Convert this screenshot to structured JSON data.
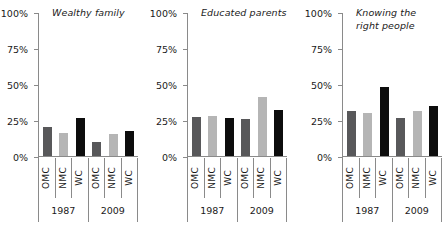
{
  "chart_data": {
    "type": "bar",
    "title": "",
    "xlabel": "",
    "ylabel": "",
    "ylim": [
      0,
      100
    ],
    "ytick_labels": [
      "100%",
      "75%",
      "50%",
      "25%",
      "0%"
    ],
    "ytick_values": [
      100,
      75,
      50,
      25,
      0
    ],
    "grid": false,
    "legend": "none",
    "categories": [
      "OMC",
      "NMC",
      "WC",
      "OMC",
      "NMC",
      "WC"
    ],
    "groups": [
      "1987",
      "2009"
    ],
    "group_span": 3,
    "colors": {
      "OMC": "#58585a",
      "NMC": "#b5b5b5",
      "WC": "#0d0d0d",
      "axis": "#8a8a8a",
      "text": "#1a1a1a",
      "background": "#ffffff"
    },
    "panels": [
      {
        "title": "Wealthy family",
        "values": [
          20,
          16,
          26.5,
          10,
          15.5,
          17.5
        ],
        "series": [
          {
            "name": "1987",
            "categories": [
              "OMC",
              "NMC",
              "WC"
            ],
            "values": [
              20,
              16,
              26.5
            ]
          },
          {
            "name": "2009",
            "categories": [
              "OMC",
              "NMC",
              "WC"
            ],
            "values": [
              10,
              15.5,
              17.5
            ]
          }
        ]
      },
      {
        "title": "Educated parents",
        "values": [
          27,
          27.5,
          26.5,
          25.5,
          41,
          32
        ],
        "series": [
          {
            "name": "1987",
            "categories": [
              "OMC",
              "NMC",
              "WC"
            ],
            "values": [
              27,
              27.5,
              26.5
            ]
          },
          {
            "name": "2009",
            "categories": [
              "OMC",
              "NMC",
              "WC"
            ],
            "values": [
              25.5,
              41,
              32
            ]
          }
        ]
      },
      {
        "title": "Knowing the\nright people",
        "values": [
          31,
          30,
          48,
          26.5,
          31,
          35
        ],
        "series": [
          {
            "name": "1987",
            "categories": [
              "OMC",
              "NMC",
              "WC"
            ],
            "values": [
              31,
              30,
              48
            ]
          },
          {
            "name": "2009",
            "categories": [
              "OMC",
              "NMC",
              "WC"
            ],
            "values": [
              26.5,
              31,
              35
            ]
          }
        ]
      }
    ]
  }
}
